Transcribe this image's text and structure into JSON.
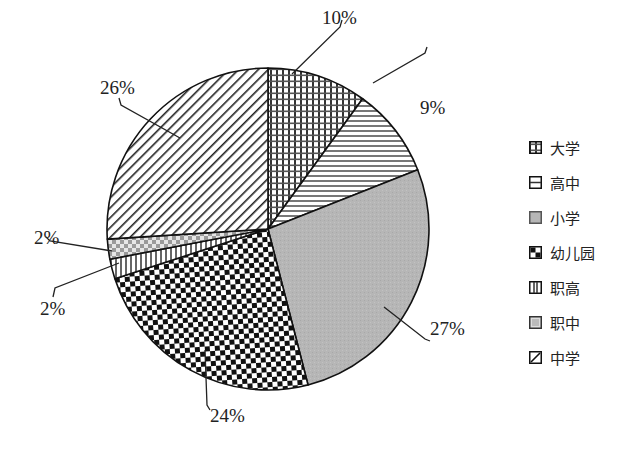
{
  "chart_data": {
    "type": "pie",
    "title": "",
    "start_angle_deg": 0,
    "direction": "clockwise",
    "categories": [
      "大学",
      "高中",
      "小学",
      "幼儿园",
      "职高",
      "职中",
      "中学"
    ],
    "values": [
      10,
      9,
      27,
      24,
      2,
      2,
      26
    ],
    "labels": [
      "10%",
      "9%",
      "27%",
      "24%",
      "2%",
      "2%",
      "26%"
    ],
    "patterns": [
      "grid-dense",
      "horizontal-lines",
      "gray-fill",
      "checkerboard",
      "vertical-lines",
      "light-checker",
      "diagonal-lines"
    ],
    "legend_position": "right",
    "colors": {
      "stroke": "#111111",
      "gray": "#b4b4b4",
      "background": "#ffffff"
    }
  },
  "legend": {
    "items": [
      {
        "label": "大学"
      },
      {
        "label": "高中"
      },
      {
        "label": "小学"
      },
      {
        "label": "幼儿园"
      },
      {
        "label": "职高"
      },
      {
        "label": "职中"
      },
      {
        "label": "中学"
      }
    ]
  }
}
